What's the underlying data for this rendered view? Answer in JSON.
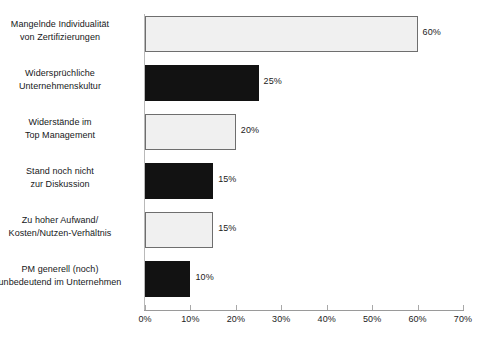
{
  "chart_data": {
    "type": "bar",
    "orientation": "horizontal",
    "title": "",
    "subtitle": "",
    "xlabel": "",
    "ylabel": "",
    "xlim": [
      0,
      70
    ],
    "grid": false,
    "legend": null,
    "categories": [
      "Mangelnde Individualität von Zertifizierungen",
      "Widersprüchliche Unternehmenskultur",
      "Widerstände im Top Management",
      "Stand noch nicht zur Diskussion",
      "Zu hoher Aufwand/ Kosten/Nutzen-Verhältnis",
      "PM generell (noch) unbedeutend im Unternehmen"
    ],
    "values": [
      60,
      25,
      20,
      15,
      15,
      10
    ],
    "value_labels": [
      "60%",
      "25%",
      "20%",
      "15%",
      "15%",
      "10%"
    ],
    "tick_labels": [
      "0%",
      "10%",
      "20%",
      "30%",
      "40%",
      "50%",
      "60%",
      "70%"
    ],
    "tick_values": [
      0,
      10,
      20,
      30,
      40,
      50,
      60,
      70
    ],
    "bar_styles": [
      "light",
      "dark",
      "light",
      "dark",
      "light",
      "dark"
    ],
    "colors": {
      "light_fill": "#f0f0f0",
      "light_border": "#6e6e6e",
      "dark_fill": "#121212",
      "axis": "#9a9a9a",
      "text": "#16181a",
      "background": "#ffffff"
    }
  },
  "bars": [
    {
      "label_line1": "Mangelnde Individualität",
      "label_line2": "von Zertifizierungen",
      "value_label": "60%"
    },
    {
      "label_line1": "Widersprüchliche",
      "label_line2": "Unternehmenskultur",
      "value_label": "25%"
    },
    {
      "label_line1": "Widerstände im",
      "label_line2": "Top Management",
      "value_label": "20%"
    },
    {
      "label_line1": "Stand noch nicht",
      "label_line2": "zur Diskussion",
      "value_label": "15%"
    },
    {
      "label_line1": "Zu hoher Aufwand/",
      "label_line2": "Kosten/Nutzen-Verhältnis",
      "value_label": "15%"
    },
    {
      "label_line1": "PM generell (noch)",
      "label_line2": "unbedeutend im Unternehmen",
      "value_label": "10%"
    }
  ],
  "axis": {
    "ticks": [
      {
        "label": "0%"
      },
      {
        "label": "10%"
      },
      {
        "label": "20%"
      },
      {
        "label": "30%"
      },
      {
        "label": "40%"
      },
      {
        "label": "50%"
      },
      {
        "label": "60%"
      },
      {
        "label": "70%"
      }
    ]
  }
}
